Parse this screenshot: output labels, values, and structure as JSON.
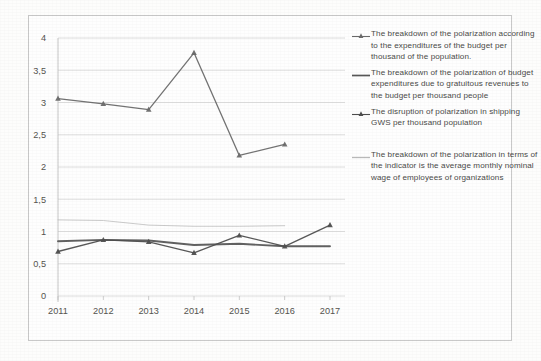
{
  "chart_data": {
    "type": "line",
    "title": "",
    "subtitle": "",
    "xlabel": "",
    "ylabel": "",
    "categories": [
      "2011",
      "2012",
      "2013",
      "2014",
      "2015",
      "2016",
      "2017"
    ],
    "x_tick_labels": [
      "2011",
      "2012",
      "2013",
      "2014",
      "2015",
      "2016",
      "2017"
    ],
    "y_tick_labels": [
      "0",
      "0,5",
      "1",
      "1,5",
      "2",
      "2,5",
      "3",
      "3,5",
      "4"
    ],
    "y_tick_values": [
      0,
      0.5,
      1,
      1.5,
      2,
      2.5,
      3,
      3.5,
      4
    ],
    "ylim": [
      0,
      4
    ],
    "grid": true,
    "grid_axis": "y",
    "legend_position": "right",
    "series": [
      {
        "name": "The breakdown of the polarization according to the expenditures of the budget per thousand of the population.",
        "marker": "triangle",
        "color": "#6b6b6b",
        "values": [
          3.06,
          2.98,
          2.89,
          3.77,
          2.18,
          2.35,
          null
        ]
      },
      {
        "name": "The breakdown of the polarization of budget expenditures due to gratuitous revenues to the budget per thousand people",
        "marker": "none",
        "color": "#595959",
        "values": [
          0.85,
          0.87,
          0.86,
          0.79,
          0.81,
          0.77,
          0.77
        ]
      },
      {
        "name": "The disruption of polarization in shipping GWS per thousand population",
        "marker": "triangle",
        "color": "#4f4f4f",
        "values": [
          0.69,
          0.87,
          0.84,
          0.67,
          0.94,
          0.77,
          1.1
        ]
      },
      {
        "name": "The breakdown of the polarization in terms of the indicator is the average monthly nominal wage of employees of organizations",
        "marker": "none",
        "color": "#b9b9b9",
        "values": [
          1.18,
          1.17,
          1.1,
          1.08,
          1.08,
          1.09,
          null
        ]
      }
    ]
  },
  "legend": {
    "entries": [
      {
        "label": "The breakdown of the polarization according to the expenditures of the budget per thousand of the population."
      },
      {
        "label": "The breakdown of the polarization of budget expenditures due to gratuitous revenues to the budget per thousand people"
      },
      {
        "label": "The disruption of polarization in shipping GWS per thousand population"
      },
      {
        "label": "The breakdown of the polarization in terms of the indicator is the average monthly nominal wage of employees of organizations"
      }
    ]
  },
  "colors": {
    "grid": "#d6d6d6",
    "axis": "#c0c0c0",
    "frame": "#c9c9c9",
    "text": "#55544f",
    "series1": "#6b6b6b",
    "series2": "#595959",
    "series3": "#4f4f4f",
    "series4": "#b9b9b9"
  }
}
